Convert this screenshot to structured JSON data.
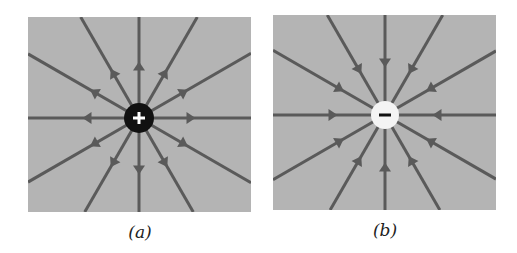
{
  "figure": {
    "panels": [
      {
        "id": "a",
        "caption": "(a)",
        "charge_sign": "+",
        "charge_label": "positive charge",
        "field_direction": "outward",
        "line_count": 12,
        "charge_fill": "#111111",
        "sign_color": "#ffffff"
      },
      {
        "id": "b",
        "caption": "(b)",
        "charge_sign": "−",
        "charge_label": "negative charge",
        "field_direction": "inward",
        "line_count": 12,
        "charge_fill": "#f4f4f4",
        "sign_color": "#111111"
      }
    ],
    "colors": {
      "background": "#b4b4b4",
      "field_line": "#5a5a5a"
    }
  }
}
